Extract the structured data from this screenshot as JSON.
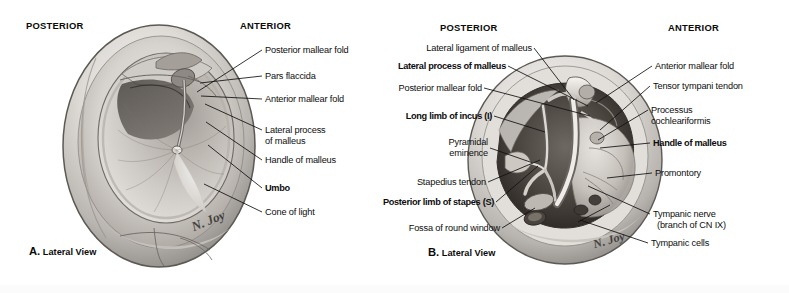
{
  "plate": {
    "width": 789,
    "height": 293,
    "background": "#ffffff",
    "ink": "#111111"
  },
  "panel_a": {
    "id": "A",
    "caption_letter": "A.",
    "caption_text": "Lateral View",
    "orientation_left": "POSTERIOR",
    "orientation_right": "ANTERIOR",
    "signature": "N. Joy",
    "labels": [
      {
        "text": "Posterior mallear fold",
        "bold": false,
        "italic": false
      },
      {
        "text": "Pars flaccida",
        "bold": false,
        "italic": false
      },
      {
        "text": "Anterior mallear fold",
        "bold": false,
        "italic": false
      },
      {
        "text": "Lateral process",
        "bold": false,
        "italic": false
      },
      {
        "text": "of malleus",
        "bold": false,
        "italic": false
      },
      {
        "text": "Handle of malleus",
        "bold": false,
        "italic": false
      },
      {
        "text": "Umbo",
        "bold": true,
        "italic": false
      },
      {
        "text": "Cone of light",
        "bold": false,
        "italic": false
      }
    ]
  },
  "panel_b": {
    "id": "B",
    "caption_letter": "B.",
    "caption_text": "Lateral View",
    "orientation_left": "POSTERIOR",
    "orientation_right": "ANTERIOR",
    "signature": "N. Joy",
    "labels_left": [
      {
        "text": "Lateral ligament of malleus",
        "bold": false,
        "italic": false
      },
      {
        "text": "Lateral process of malleus",
        "bold": true,
        "italic": false
      },
      {
        "text": "Posterior mallear fold",
        "bold": false,
        "italic": false
      },
      {
        "text": "Long limb of incus",
        "suffix": "(I)",
        "bold": true,
        "italic_suffix": true
      },
      {
        "text": "Pyramidal",
        "bold": false,
        "italic": false
      },
      {
        "text": "eminence",
        "bold": false,
        "italic": false
      },
      {
        "text": "Stapedius tendon",
        "bold": false,
        "italic": false
      },
      {
        "text": "Posterior limb of stapes",
        "suffix": "(S)",
        "bold": true,
        "italic_suffix": true
      },
      {
        "text": "Fossa of round window",
        "bold": false,
        "italic": false
      }
    ],
    "labels_right": [
      {
        "text": "Anterior mallear fold",
        "bold": false,
        "italic": false
      },
      {
        "text": "Tensor tympani tendon",
        "bold": false,
        "italic": false
      },
      {
        "text": "Processus",
        "bold": false,
        "italic": false
      },
      {
        "text": "cochleariformis",
        "bold": false,
        "italic": false
      },
      {
        "text": "Handle of malleus",
        "bold": true,
        "italic": false
      },
      {
        "text": "Promontory",
        "bold": false,
        "italic": false
      },
      {
        "text": "Tympanic nerve",
        "bold": false,
        "italic": false
      },
      {
        "text": "(branch of CN IX)",
        "bold": false,
        "italic": false
      },
      {
        "text": "Tympanic cells",
        "bold": false,
        "italic": false
      }
    ]
  }
}
